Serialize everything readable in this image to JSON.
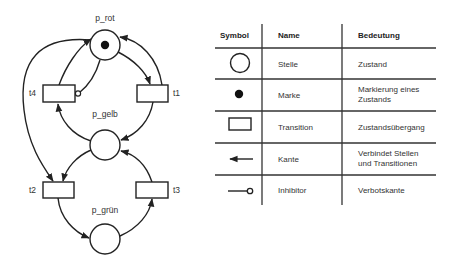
{
  "petri_net": {
    "places": [
      {
        "id": "p_rot",
        "label": "p_rot",
        "tokens": 1
      },
      {
        "id": "p_gelb",
        "label": "p_gelb",
        "tokens": 0
      },
      {
        "id": "p_gruen",
        "label": "p_grün",
        "tokens": 0
      }
    ],
    "transitions": [
      {
        "id": "t1",
        "label": "t1"
      },
      {
        "id": "t2",
        "label": "t2"
      },
      {
        "id": "t3",
        "label": "t3"
      },
      {
        "id": "t4",
        "label": "t4"
      }
    ],
    "arcs": [
      {
        "from": "p_rot",
        "to": "t1",
        "type": "normal"
      },
      {
        "from": "t1",
        "to": "p_rot",
        "type": "normal"
      },
      {
        "from": "t1",
        "to": "p_gelb",
        "type": "normal"
      },
      {
        "from": "p_gelb",
        "to": "t4",
        "type": "normal"
      },
      {
        "from": "t4",
        "to": "p_rot",
        "type": "normal"
      },
      {
        "from": "p_rot",
        "to": "t4",
        "type": "inhibitor"
      },
      {
        "from": "p_rot",
        "to": "t2",
        "type": "normal"
      },
      {
        "from": "p_gelb",
        "to": "t2",
        "type": "normal"
      },
      {
        "from": "t2",
        "to": "p_gruen",
        "type": "normal"
      },
      {
        "from": "p_gruen",
        "to": "t3",
        "type": "normal"
      },
      {
        "from": "t3",
        "to": "p_gelb",
        "type": "normal"
      }
    ]
  },
  "legend": {
    "headers": {
      "symbol": "Symbol",
      "name": "Name",
      "meaning": "Bedeutung"
    },
    "rows": [
      {
        "symbol": "circle-icon",
        "name": "Stelle",
        "meaning_lines": [
          "Zustand"
        ]
      },
      {
        "symbol": "token-dot-icon",
        "name": "Marke",
        "meaning_lines": [
          "Markierung eines",
          "Zustands"
        ]
      },
      {
        "symbol": "rectangle-icon",
        "name": "Transition",
        "meaning_lines": [
          "Zustandsübergang"
        ]
      },
      {
        "symbol": "arrow-left-icon",
        "name": "Kante",
        "meaning_lines": [
          "Verbindet Stellen",
          "und Transitionen"
        ]
      },
      {
        "symbol": "inhibitor-arc-icon",
        "name": "Inhibitor",
        "meaning_lines": [
          "Verbotskante"
        ]
      }
    ]
  },
  "colors": {
    "stroke": "#222222",
    "text": "#333333",
    "background": "#ffffff"
  }
}
